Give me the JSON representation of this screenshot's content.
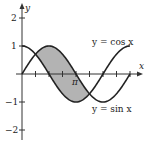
{
  "chart_data": {
    "type": "line",
    "title": "",
    "xlabel": "x",
    "ylabel": "y",
    "xlim": [
      0,
      6.2832
    ],
    "ylim": [
      -2,
      2
    ],
    "y_ticks": [
      "2",
      "1",
      "-1",
      "-2"
    ],
    "x_tick_labels": [
      "π"
    ],
    "x_tick_spacing": "π/4",
    "grid": false,
    "series": [
      {
        "name": "y = cos x",
        "function": "cos(x)",
        "domain": [
          0,
          6.2832
        ]
      },
      {
        "name": "y = sin x",
        "function": "sin(x)",
        "domain": [
          0,
          6.2832
        ]
      }
    ],
    "shaded_region": {
      "between": [
        "y = sin x",
        "y = cos x"
      ],
      "x_range": [
        0.7854,
        3.927
      ],
      "description": "region where sin x ≥ cos x, from π/4 to 5π/4",
      "color": "#b3b3b3"
    },
    "annotations": [
      {
        "text": "y = cos x",
        "near": "upper right"
      },
      {
        "text": "y = sin x",
        "near": "lower right"
      }
    ]
  },
  "labels": {
    "x_axis": "x",
    "y_axis": "y",
    "y2": "2",
    "y1": "1",
    "ym1": "−1",
    "ym2": "−2",
    "pi": "π",
    "cos_label": "y = cos x",
    "sin_label": "y = sin x"
  },
  "colors": {
    "curve": "#222222",
    "axis": "#333333",
    "shade": "#b3b3b3"
  }
}
